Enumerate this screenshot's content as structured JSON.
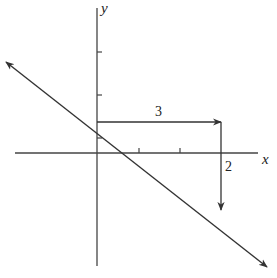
{
  "diagram": {
    "type": "coordinate-plane-line-slope",
    "axes": {
      "x_label": "x",
      "y_label": "y"
    },
    "line": {
      "description": "Line with negative slope, arrows at both ends",
      "y_intercept_marked": true
    },
    "run_arrow": {
      "label": "3",
      "direction": "right"
    },
    "rise_arrow": {
      "label": "2",
      "direction": "down"
    },
    "colors": {
      "stroke": "#333333",
      "background": "#ffffff"
    }
  }
}
